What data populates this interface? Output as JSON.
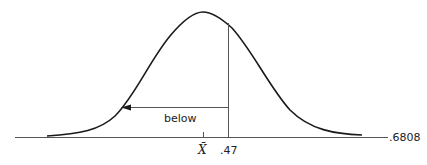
{
  "diagram": {
    "type": "normal-distribution-curve",
    "mean_label": "X̄",
    "value_label": ".47",
    "arrow_label": "below",
    "right_label": ".6808",
    "colors": {
      "curve": "#1a1a1a",
      "line": "#555555",
      "text": "#222222"
    }
  }
}
